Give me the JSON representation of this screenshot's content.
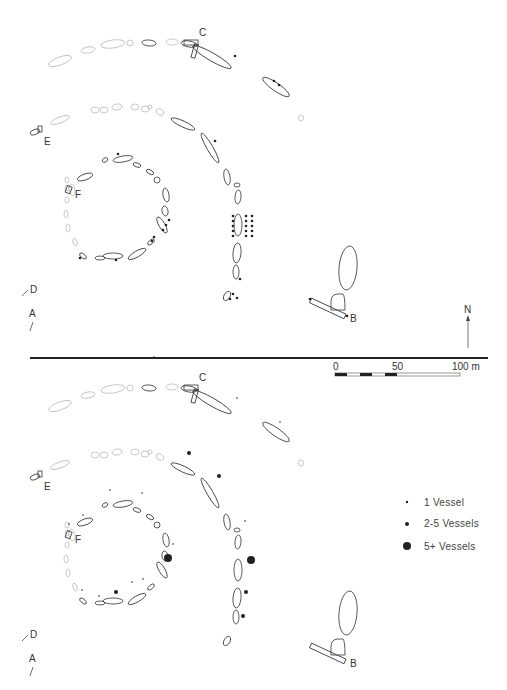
{
  "diagram": {
    "title": "",
    "panels": [
      {
        "id": "upper",
        "labels": [
          "C",
          "E",
          "F",
          "D",
          "A",
          "B"
        ],
        "north_label": "N"
      },
      {
        "id": "lower",
        "labels": [
          "C",
          "E",
          "F",
          "D",
          "A",
          "B"
        ]
      }
    ],
    "scale_bar": {
      "ticks": [
        "0",
        "50",
        "100 m"
      ],
      "range_m": [
        0,
        100
      ]
    },
    "legend": {
      "items": [
        {
          "label": "1 Vessel",
          "symbol": "small-dot"
        },
        {
          "label": "2-5 Vessels",
          "symbol": "medium-dot"
        },
        {
          "label": "5+ Vessels",
          "symbol": "large-dot"
        }
      ]
    },
    "colors": {
      "ink": "#333333",
      "faint_stone": "#bbbbbb",
      "divider": "#222222"
    }
  }
}
